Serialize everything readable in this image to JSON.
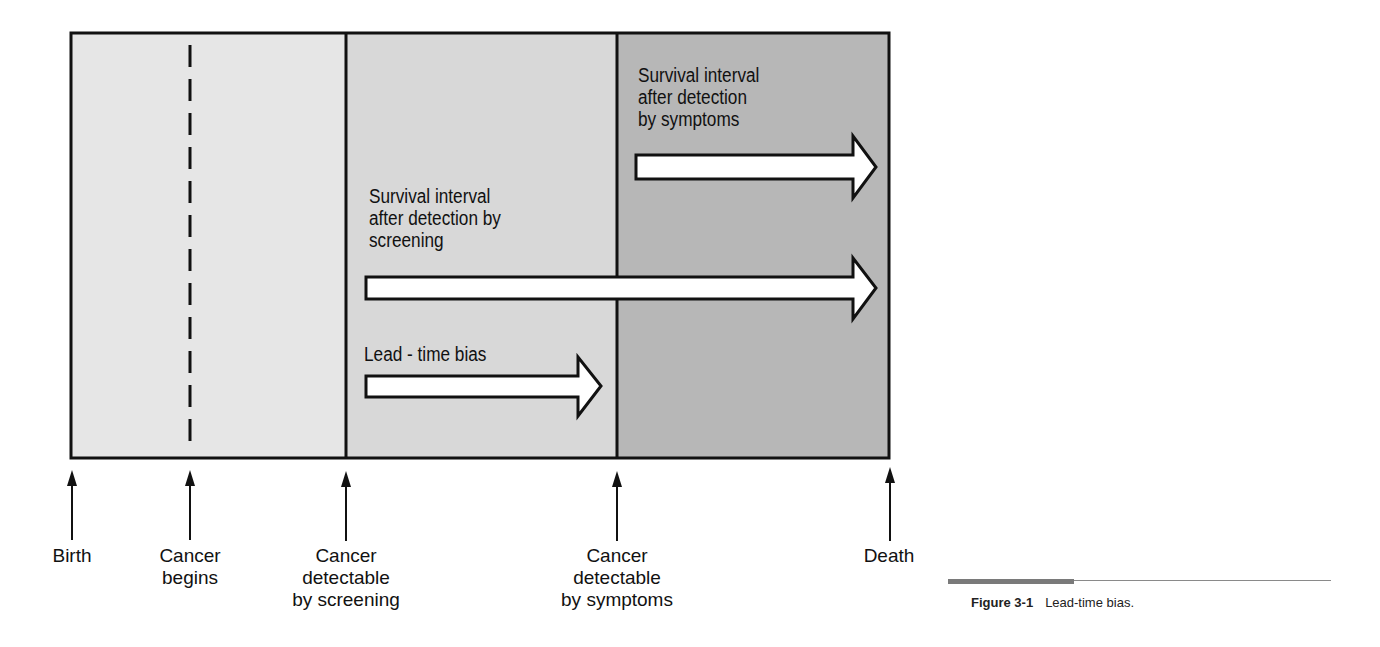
{
  "figure": {
    "caption_number": "Figure 3-1",
    "caption_text": "Lead-time bias."
  },
  "colors": {
    "region_light": "#e6e6e6",
    "region_mid": "#d7d7d7",
    "region_dark": "#b5b5b5",
    "border": "#111111",
    "arrow_fill": "#ffffff"
  },
  "regions": [
    {
      "name": "birth-to-screening-detectable",
      "x_start": 70,
      "x_end": 346
    },
    {
      "name": "screening-to-symptom-detectable",
      "x_start": 346,
      "x_end": 617
    },
    {
      "name": "symptom-detectable-to-death",
      "x_start": 617,
      "x_end": 890
    }
  ],
  "arrows": [
    {
      "label": "Survival interval\nafter detection\nby symptoms",
      "from_x": 636,
      "to_x": 876,
      "y": 167
    },
    {
      "label": "Survival interval\nafter detection by\nscreening",
      "from_x": 366,
      "to_x": 876,
      "y": 288
    },
    {
      "label": "Lead - time bias",
      "from_x": 366,
      "to_x": 601,
      "y": 386
    }
  ],
  "timeline_events": [
    {
      "label": "Birth",
      "x": 72
    },
    {
      "label": "Cancer\nbegins",
      "x": 190
    },
    {
      "label": "Cancer\ndetectable\nby screening",
      "x": 346
    },
    {
      "label": "Cancer\ndetectable\nby symptoms",
      "x": 617
    },
    {
      "label": "Death",
      "x": 890
    }
  ]
}
